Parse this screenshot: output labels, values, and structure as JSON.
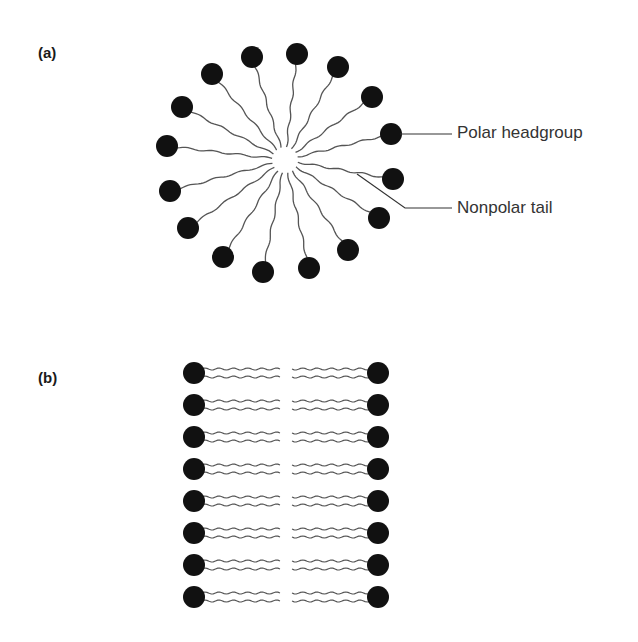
{
  "figure": {
    "panel_a": {
      "label": "(a)",
      "structure": "micelle",
      "molecule_count": 16,
      "callouts": {
        "headgroup": "Polar headgroup",
        "tail": "Nonpolar tail"
      }
    },
    "panel_b": {
      "label": "(b)",
      "structure": "bilayer",
      "row_count": 8
    },
    "colors": {
      "headgroup": "#111111",
      "tail": "#555555",
      "text": "#333333"
    }
  }
}
